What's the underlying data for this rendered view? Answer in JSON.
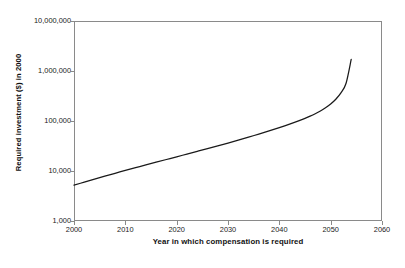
{
  "chart_data": {
    "type": "line",
    "title": "",
    "xlabel": "Year in which compensation is required",
    "ylabel": "Required investment ($) in 2000",
    "xlim": [
      2000,
      2060
    ],
    "ylim": [
      1000,
      10000000
    ],
    "yscale": "log",
    "xscale": "linear",
    "grid": false,
    "legend": false,
    "legend_position": "none",
    "xticks": [
      2000,
      2010,
      2020,
      2030,
      2040,
      2050,
      2060
    ],
    "xtick_labels": [
      "2000",
      "2010",
      "2020",
      "2030",
      "2040",
      "2050",
      "2060"
    ],
    "yticks": [
      1000,
      10000,
      100000,
      1000000,
      10000000
    ],
    "ytick_labels": [
      "1,000",
      "10,000",
      "100,000",
      "1,000,000",
      "10,000,000"
    ],
    "series": [
      {
        "name": "Required investment",
        "color": "#1a1a1a",
        "x": [
          2000,
          2002,
          2004,
          2006,
          2008,
          2010,
          2012,
          2014,
          2016,
          2018,
          2020,
          2022,
          2024,
          2026,
          2028,
          2030,
          2032,
          2034,
          2036,
          2038,
          2040,
          2042,
          2044,
          2045,
          2046,
          2047,
          2048,
          2049,
          2050,
          2051,
          2052,
          2053,
          2054
        ],
        "values": [
          5200,
          6000,
          6900,
          7900,
          9000,
          10300,
          11700,
          13200,
          15000,
          17000,
          19200,
          21800,
          24700,
          28000,
          31800,
          36200,
          41400,
          47500,
          54700,
          63300,
          73800,
          86800,
          103000,
          113000,
          125000,
          140000,
          159000,
          184000,
          219000,
          272000,
          365000,
          570000,
          1700000
        ]
      }
    ]
  },
  "axis": {
    "y_title": "Required investment ($) in 2000",
    "x_title": "Year in which compensation is required"
  }
}
